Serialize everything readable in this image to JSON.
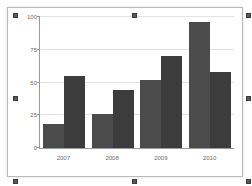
{
  "object": {
    "type_label": "chart-object",
    "selected": true,
    "handles": [
      "top-left",
      "top-center",
      "top-right",
      "middle-left",
      "middle-right",
      "bottom-left",
      "bottom-center",
      "bottom-right"
    ]
  },
  "colors": {
    "series1": "#4b4b4b",
    "series2": "#3c3c3c",
    "gridline": "#e3e3e3",
    "axis": "#9a9a9a",
    "tick_text": "#6b6b6b",
    "object_border": "#b9b9b9",
    "background": "#ffffff",
    "handle": "#5a5a5a"
  },
  "chart_data": {
    "type": "bar",
    "title": "",
    "xlabel": "",
    "ylabel": "",
    "categories": [
      "2007",
      "2008",
      "2009",
      "2010"
    ],
    "series": [
      {
        "name": "Series 1",
        "values": [
          18,
          26,
          52,
          96
        ]
      },
      {
        "name": "Series 2",
        "values": [
          55,
          44,
          70,
          58
        ]
      }
    ],
    "ylim": [
      0,
      100
    ],
    "yticks": [
      0,
      25,
      50,
      75,
      100
    ],
    "ytick_labels": [
      "0",
      "25",
      "50",
      "75",
      "100"
    ],
    "grid": true,
    "legend": false,
    "legend_position": "none",
    "grouped": true,
    "bar_gap": 0
  }
}
